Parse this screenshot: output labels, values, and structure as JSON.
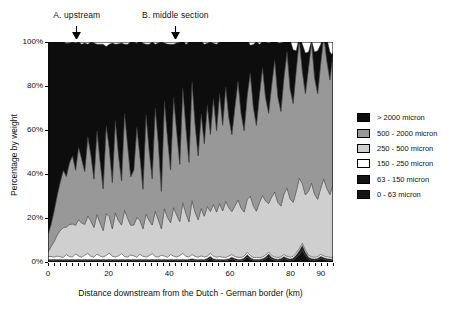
{
  "chart_data": {
    "type": "area",
    "stacked": true,
    "title": "",
    "xlabel": "Distance downstream from the Dutch - German border (km)",
    "ylabel": "Percentage by weight",
    "xlim": [
      0,
      94
    ],
    "ylim": [
      0,
      100
    ],
    "xticks": [
      0,
      20,
      40,
      60,
      80,
      90
    ],
    "xtick_labels": [
      "0",
      "20",
      "40",
      "60",
      "80",
      "90"
    ],
    "yticks": [
      0,
      20,
      40,
      60,
      80,
      100
    ],
    "ytick_labels": [
      "0%",
      "20%",
      "40%",
      "60%",
      "80%",
      "100%"
    ],
    "grid": false,
    "legend_position": "right",
    "annotations": [
      {
        "label": "A. upstream",
        "x": 9.5,
        "marker": "down-arrow"
      },
      {
        "label": "B. middle section",
        "x": 42.0,
        "marker": "down-arrow"
      }
    ],
    "series": [
      {
        "name": "0 - 63 micron",
        "color": "#111111",
        "order": 1,
        "values": [
          0.6,
          0.5,
          0.6,
          0.5,
          0.6,
          0.5,
          0.6,
          0.5,
          0.6,
          0.5,
          0.6,
          0.5,
          0.6,
          0.5,
          0.6,
          0.5,
          0.6,
          0.5,
          0.6,
          0.5,
          0.6,
          0.5,
          0.6,
          0.5,
          0.6,
          0.5,
          0.6,
          0.5,
          0.6,
          0.5,
          0.6,
          0.5,
          0.6,
          0.5,
          0.6,
          0.5,
          0.6,
          0.5,
          0.6,
          0.5,
          0.6,
          0.5,
          0.6,
          0.5,
          0.6,
          0.5,
          0.6,
          0.8,
          0.6,
          0.5,
          0.6,
          0.5,
          0.9,
          1.6,
          0.8,
          0.6,
          0.6,
          0.5,
          0.6,
          0.8,
          1.4,
          0.9,
          0.6,
          0.6,
          1.0,
          2.2,
          1.2,
          0.7,
          0.6,
          0.6,
          0.8,
          1.4,
          2.4,
          1.3,
          0.8,
          0.7,
          0.9,
          1.5,
          1.0,
          0.8,
          1.0,
          2.0,
          3.4,
          5.2,
          3.0,
          1.4,
          0.9,
          0.8,
          1.0,
          1.6,
          1.2,
          0.9,
          0.8,
          0.7
        ]
      },
      {
        "name": "63 - 150 micron",
        "color": "#222222",
        "order": 2,
        "values": [
          0.6,
          0.6,
          0.6,
          0.6,
          0.6,
          0.6,
          0.6,
          0.6,
          0.6,
          0.6,
          0.6,
          0.6,
          0.6,
          0.6,
          0.6,
          0.6,
          0.6,
          0.6,
          0.6,
          0.6,
          0.6,
          0.6,
          0.6,
          0.6,
          0.6,
          0.6,
          0.6,
          0.6,
          0.6,
          0.6,
          0.6,
          0.6,
          0.6,
          0.6,
          0.6,
          0.6,
          0.6,
          0.6,
          0.6,
          0.6,
          0.6,
          0.6,
          0.6,
          0.6,
          0.6,
          0.6,
          0.6,
          0.7,
          0.6,
          0.6,
          0.6,
          0.6,
          0.8,
          1.0,
          0.7,
          0.6,
          0.6,
          0.6,
          0.6,
          0.7,
          0.9,
          0.7,
          0.6,
          0.6,
          0.8,
          1.2,
          0.9,
          0.6,
          0.6,
          0.6,
          0.7,
          0.9,
          1.3,
          0.9,
          0.7,
          0.6,
          0.7,
          1.0,
          0.8,
          0.6,
          0.8,
          1.2,
          1.8,
          2.4,
          1.6,
          0.9,
          0.7,
          0.6,
          0.7,
          1.0,
          0.8,
          0.7,
          0.6,
          0.6
        ]
      },
      {
        "name": "150 - 250 micron",
        "color": "#ffffff",
        "order": 3,
        "values": [
          1.3,
          1.4,
          1.1,
          1.6,
          1.2,
          1.0,
          2.2,
          1.4,
          1.1,
          2.6,
          1.5,
          1.1,
          1.9,
          2.8,
          1.4,
          1.1,
          2.4,
          1.6,
          1.1,
          1.9,
          2.9,
          1.5,
          1.1,
          1.7,
          2.6,
          1.4,
          1.1,
          2.1,
          1.6,
          1.1,
          2.3,
          1.5,
          1.1,
          1.8,
          2.6,
          1.4,
          1.1,
          2.0,
          1.5,
          1.1,
          2.2,
          1.6,
          1.1,
          1.8,
          2.7,
          1.5,
          1.1,
          1.9,
          1.4,
          1.1,
          1.6,
          1.2,
          1.0,
          1.4,
          1.2,
          1.0,
          1.3,
          1.1,
          0.9,
          1.2,
          1.1,
          0.9,
          1.0,
          0.9,
          0.9,
          1.0,
          0.9,
          0.8,
          0.9,
          0.8,
          0.8,
          0.9,
          0.9,
          0.8,
          0.8,
          0.8,
          0.8,
          0.9,
          0.8,
          0.8,
          0.8,
          0.9,
          0.9,
          1.0,
          0.9,
          0.8,
          0.8,
          0.8,
          0.8,
          0.9,
          0.8,
          0.8,
          0.8,
          0.8
        ]
      },
      {
        "name": "250 - 500 micron",
        "color": "#cfcfcf",
        "order": 4,
        "values": [
          2.0,
          4.5,
          7.0,
          9.5,
          12.0,
          13.5,
          12.5,
          14.5,
          15.0,
          13.0,
          16.5,
          15.5,
          14.0,
          17.0,
          16.0,
          13.5,
          18.0,
          15.0,
          12.0,
          19.0,
          16.5,
          12.5,
          20.0,
          16.0,
          13.0,
          21.0,
          17.5,
          13.5,
          14.0,
          18.0,
          15.5,
          12.5,
          19.5,
          16.0,
          13.0,
          20.5,
          17.0,
          12.0,
          21.5,
          18.0,
          14.5,
          22.0,
          19.0,
          15.5,
          23.0,
          19.5,
          16.0,
          24.5,
          20.0,
          17.0,
          21.5,
          18.5,
          22.5,
          19.0,
          23.5,
          20.5,
          24.0,
          21.0,
          25.5,
          22.0,
          19.5,
          23.0,
          26.0,
          22.5,
          20.0,
          24.0,
          27.0,
          23.5,
          21.0,
          25.0,
          28.0,
          24.5,
          22.0,
          26.5,
          29.5,
          25.0,
          23.0,
          27.5,
          31.0,
          26.5,
          24.5,
          28.0,
          32.0,
          27.0,
          25.0,
          29.0,
          33.5,
          28.5,
          26.0,
          30.0,
          35.0,
          31.0,
          28.5,
          33.0,
          36.0
        ]
      },
      {
        "name": "500 - 2000 micron",
        "color": "#989898",
        "order": 5,
        "values": [
          8.0,
          10.0,
          14.0,
          18.0,
          22.0,
          26.0,
          23.0,
          28.0,
          31.0,
          25.0,
          33.0,
          29.0,
          24.0,
          36.0,
          30.0,
          22.0,
          38.0,
          28.0,
          19.0,
          40.0,
          31.0,
          21.0,
          42.0,
          30.0,
          20.0,
          44.0,
          33.0,
          22.0,
          25.0,
          41.0,
          29.0,
          18.0,
          45.0,
          32.0,
          21.0,
          47.0,
          35.0,
          17.0,
          49.0,
          36.0,
          24.0,
          50.0,
          38.0,
          26.0,
          52.0,
          39.0,
          27.0,
          54.0,
          40.0,
          29.0,
          43.0,
          33.0,
          46.0,
          35.0,
          48.0,
          37.0,
          50.0,
          39.0,
          52.0,
          41.0,
          35.0,
          45.0,
          54.0,
          43.0,
          37.0,
          47.0,
          56.0,
          45.0,
          39.0,
          49.0,
          58.0,
          47.0,
          41.0,
          51.0,
          60.0,
          48.0,
          43.0,
          53.0,
          62.0,
          50.0,
          45.0,
          55.0,
          63.0,
          51.0,
          46.0,
          56.0,
          64.0,
          53.0,
          48.0,
          57.0,
          65.0,
          58.0,
          52.0,
          60.0,
          63.0
        ]
      },
      {
        "name": "> 2000 micron",
        "color": "#0d0d0d",
        "order": 6,
        "values": [
          87.5,
          83.0,
          76.7,
          69.8,
          63.6,
          58.4,
          60.5,
          54.5,
          51.7,
          57.8,
          47.8,
          52.3,
          58.5,
          42.1,
          51.4,
          61.8,
          39.4,
          53.3,
          65.7,
          36.0,
          47.4,
          63.4,
          34.7,
          50.4,
          62.8,
          31.5,
          46.2,
          61.3,
          58.2,
          38.2,
          52.8,
          66.3,
          32.2,
          48.1,
          62.2,
          29.0,
          45.3,
          67.9,
          26.3,
          42.9,
          57.1,
          24.3,
          40.3,
          55.5,
          22.1,
          37.8,
          54.7,
          18.1,
          37.4,
          51.8,
          33.1,
          45.2,
          28.2,
          42.0,
          25.2,
          39.3,
          23.5,
          37.8,
          20.4,
          34.3,
          42.5,
          30.0,
          19.4,
          32.4,
          40.7,
          25.8,
          12.5,
          28.3,
          38.1,
          23.0,
          11.7,
          25.3,
          32.0,
          19.5,
          11.2,
          24.4,
          31.2,
          16.1,
          4.4,
          22.3,
          24.4,
          8.9,
          1.5,
          12.4,
          18.5,
          7.4,
          0.6,
          11.8,
          19.5,
          8.5,
          0.4,
          10.1,
          12.8,
          -1.4
        ]
      }
    ]
  },
  "legend": {
    "items": [
      {
        "label": "> 2000 micron",
        "color": "#0d0d0d"
      },
      {
        "label": "500 - 2000 micron",
        "color": "#989898"
      },
      {
        "label": "250 - 500 micron",
        "color": "#cfcfcf"
      },
      {
        "label": "150 - 250 micron",
        "color": "#ffffff"
      },
      {
        "label": "63 - 150 micron",
        "color": "#141414"
      },
      {
        "label": "0 - 63 micron",
        "color": "#141414"
      }
    ]
  }
}
